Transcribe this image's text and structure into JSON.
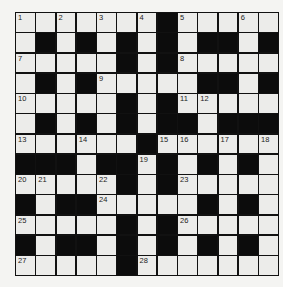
{
  "puzzle": {
    "rows": 13,
    "cols": 13,
    "grid": [
      ".......#.....",
      ".#.#.#.#.##.#",
      ".....#.#.....",
      ".#.#.....##.#",
      ".....#.#.....",
      ".#.#.#.##.###",
      "......#......",
      "###.##.#.#.#.",
      ".....#.#.....",
      "#.##.....#.#.",
      ".....#.#.....",
      "#.##.#.#.#.#.",
      ".....#......."
    ],
    "numbers": [
      {
        "r": 0,
        "c": 0,
        "n": "1"
      },
      {
        "r": 0,
        "c": 2,
        "n": "2"
      },
      {
        "r": 0,
        "c": 4,
        "n": "3"
      },
      {
        "r": 0,
        "c": 6,
        "n": "4"
      },
      {
        "r": 0,
        "c": 8,
        "n": "5"
      },
      {
        "r": 0,
        "c": 11,
        "n": "6"
      },
      {
        "r": 2,
        "c": 0,
        "n": "7"
      },
      {
        "r": 2,
        "c": 8,
        "n": "8"
      },
      {
        "r": 3,
        "c": 4,
        "n": "9"
      },
      {
        "r": 4,
        "c": 0,
        "n": "10"
      },
      {
        "r": 4,
        "c": 8,
        "n": "11"
      },
      {
        "r": 4,
        "c": 9,
        "n": "12"
      },
      {
        "r": 6,
        "c": 0,
        "n": "13"
      },
      {
        "r": 6,
        "c": 3,
        "n": "14"
      },
      {
        "r": 6,
        "c": 7,
        "n": "15"
      },
      {
        "r": 6,
        "c": 8,
        "n": "16"
      },
      {
        "r": 6,
        "c": 10,
        "n": "17"
      },
      {
        "r": 6,
        "c": 12,
        "n": "18"
      },
      {
        "r": 7,
        "c": 6,
        "n": "19"
      },
      {
        "r": 8,
        "c": 0,
        "n": "20"
      },
      {
        "r": 8,
        "c": 1,
        "n": "21"
      },
      {
        "r": 8,
        "c": 4,
        "n": "22"
      },
      {
        "r": 8,
        "c": 8,
        "n": "23"
      },
      {
        "r": 9,
        "c": 4,
        "n": "24"
      },
      {
        "r": 10,
        "c": 0,
        "n": "25"
      },
      {
        "r": 10,
        "c": 8,
        "n": "26"
      },
      {
        "r": 12,
        "c": 0,
        "n": "27"
      },
      {
        "r": 12,
        "c": 6,
        "n": "28"
      }
    ]
  }
}
